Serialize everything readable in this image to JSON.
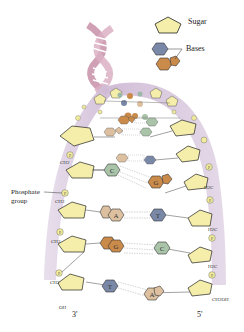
{
  "legend": {
    "sugar_label": "Sugar",
    "bases_label": "Bases"
  },
  "labels": {
    "phosphate_line1": "Phosphate",
    "phosphate_line2": "group",
    "end_left": "3'",
    "end_right": "5'",
    "oh": "OH",
    "ch2oh": "CH2OH",
    "ch2": "CH2",
    "h2c": "H2C",
    "p": "P"
  },
  "base_pairs": [
    {
      "left": "C",
      "right": "G"
    },
    {
      "left": "A",
      "right": "T"
    },
    {
      "left": "G",
      "right": "C"
    },
    {
      "left": "T",
      "right": "A"
    }
  ],
  "colors": {
    "sugar": "#f5eeaa",
    "purine": "#c98a4a",
    "purine_light": "#dcc0a0",
    "pyrimidine_blue": "#7a88a8",
    "pyrimidine_green": "#a9c4a8",
    "backbone": "#d9c8de",
    "phosphate": "#f2ec9a",
    "helix": "#c890a8"
  }
}
